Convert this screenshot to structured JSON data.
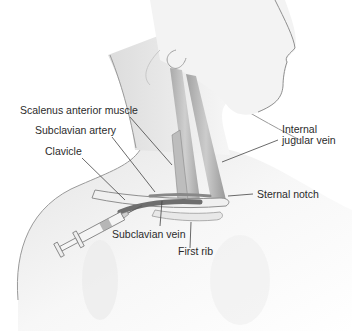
{
  "figure": {
    "labels": {
      "scalenus_anterior_muscle": "Scalenus anterior muscle",
      "subclavian_artery": "Subclavian artery",
      "clavicle": "Clavicle",
      "internal_jugular_vein_line1": "Internal",
      "internal_jugular_vein_line2": "jugular vein",
      "sternal_notch": "Sternal notch",
      "subclavian_vein": "Subclavian vein",
      "first_rib": "First rib"
    },
    "colors": {
      "skin_outline": "#8a8a8a",
      "skin_shade": "#e6e6e6",
      "muscle": "#a9a9a9",
      "vessel": "#6e6e6e",
      "leader_line": "#444444",
      "text": "#2b2b2b"
    }
  }
}
